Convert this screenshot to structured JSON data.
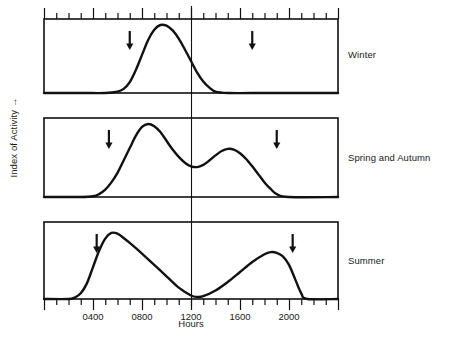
{
  "figure": {
    "y_axis_label": "Index of Activity →",
    "x_axis_title": "Hours"
  },
  "panels": [
    {
      "label": "Winter"
    },
    {
      "label": "Spring and Autumn"
    },
    {
      "label": "Summer"
    }
  ],
  "chart_data": {
    "type": "line",
    "title": "",
    "xlabel": "Hours",
    "ylabel": "Index of Activity →",
    "xlim": [
      0,
      2400
    ],
    "ylim": [
      0,
      1
    ],
    "grid": false,
    "legend": "right, panel labels",
    "tick_labels": [
      "0400",
      "0800",
      "1200",
      "1600",
      "2000"
    ],
    "tick_values": [
      400,
      800,
      1200,
      1600,
      2000
    ],
    "minor_tick_interval_hours": 100,
    "major_tick_interval_hours": 400,
    "reference_line": {
      "x": 1200,
      "label": "1200",
      "spans_all_panels": true
    },
    "panels": [
      {
        "name": "Winter",
        "pattern": "unimodal",
        "markers": {
          "name": "arrows",
          "x": [
            700,
            1700
          ],
          "meaning": "sunrise and sunset"
        },
        "x": [
          0,
          300,
          500,
          600,
          650,
          700,
          750,
          800,
          850,
          900,
          950,
          1000,
          1050,
          1100,
          1150,
          1200,
          1250,
          1300,
          1350,
          1400,
          1500,
          1800,
          2100,
          2400
        ],
        "y": [
          0,
          0,
          0,
          0.02,
          0.06,
          0.16,
          0.34,
          0.56,
          0.78,
          0.93,
          1.0,
          0.99,
          0.92,
          0.8,
          0.64,
          0.47,
          0.3,
          0.17,
          0.08,
          0.02,
          0,
          0,
          0,
          0
        ]
      },
      {
        "name": "Spring and Autumn",
        "pattern": "bimodal",
        "markers": {
          "name": "arrows",
          "x": [
            530,
            1900
          ],
          "meaning": "sunrise and sunset"
        },
        "x": [
          0,
          300,
          400,
          450,
          500,
          550,
          600,
          650,
          700,
          750,
          800,
          850,
          900,
          950,
          1000,
          1050,
          1100,
          1150,
          1200,
          1250,
          1300,
          1350,
          1400,
          1450,
          1500,
          1550,
          1600,
          1650,
          1700,
          1750,
          1800,
          1850,
          1900,
          2000,
          2400
        ],
        "y": [
          0,
          0,
          0.01,
          0.04,
          0.1,
          0.2,
          0.33,
          0.5,
          0.67,
          0.84,
          0.96,
          1.0,
          0.97,
          0.89,
          0.77,
          0.65,
          0.55,
          0.47,
          0.42,
          0.41,
          0.44,
          0.5,
          0.57,
          0.63,
          0.66,
          0.65,
          0.6,
          0.52,
          0.42,
          0.31,
          0.2,
          0.11,
          0.04,
          0,
          0
        ]
      },
      {
        "name": "Summer",
        "pattern": "strongly bimodal",
        "markers": {
          "name": "arrows",
          "x": [
            430,
            2030
          ],
          "meaning": "sunrise and sunset"
        },
        "x": [
          0,
          200,
          250,
          300,
          350,
          400,
          450,
          500,
          550,
          600,
          650,
          700,
          800,
          900,
          1000,
          1100,
          1200,
          1250,
          1300,
          1400,
          1500,
          1600,
          1700,
          1800,
          1850,
          1900,
          1950,
          2000,
          2050,
          2100,
          2150,
          2400
        ],
        "y": [
          0,
          0,
          0.02,
          0.08,
          0.22,
          0.45,
          0.68,
          0.85,
          0.93,
          0.92,
          0.86,
          0.79,
          0.64,
          0.48,
          0.32,
          0.16,
          0.05,
          0.03,
          0.04,
          0.12,
          0.24,
          0.38,
          0.52,
          0.63,
          0.66,
          0.65,
          0.6,
          0.48,
          0.28,
          0.08,
          0,
          0
        ]
      }
    ]
  }
}
